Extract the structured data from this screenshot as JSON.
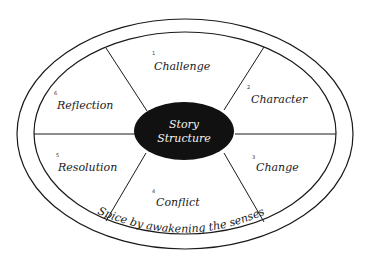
{
  "diagram": {
    "title": "Story Structure",
    "center": {
      "line1": "Story",
      "line2": "Structure"
    },
    "segments": [
      {
        "number": "1",
        "label": "Challenge"
      },
      {
        "number": "2",
        "label": "Character"
      },
      {
        "number": "3",
        "label": "Change"
      },
      {
        "number": "4",
        "label": "Conflict"
      },
      {
        "number": "5",
        "label": "Resolution"
      },
      {
        "number": "6",
        "label": "Reflection"
      }
    ],
    "ring_text": "Spice by awakening the senses",
    "colors": {
      "line": "#1a1a1a",
      "center_fill": "#111111",
      "center_text": "#f2f2f2",
      "background": "#ffffff"
    }
  }
}
